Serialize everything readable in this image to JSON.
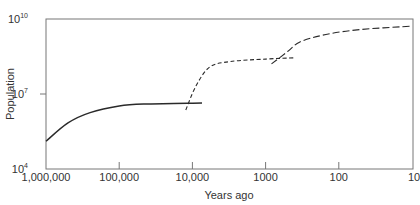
{
  "chart_data": {
    "type": "line",
    "title": "",
    "xlabel": "Years ago",
    "ylabel": "Population",
    "x_scale": "log-reversed",
    "y_scale": "log",
    "xlim": [
      1000000,
      10
    ],
    "ylim": [
      10000,
      10000000000
    ],
    "grid": false,
    "legend": "none",
    "x_ticks": [
      {
        "value": 1000000,
        "label": "1,000,000"
      },
      {
        "value": 100000,
        "label": "100,000"
      },
      {
        "value": 10000,
        "label": "10,000"
      },
      {
        "value": 1000,
        "label": "1000"
      },
      {
        "value": 100,
        "label": "100"
      },
      {
        "value": 10,
        "label": "10"
      }
    ],
    "y_ticks": [
      {
        "value": 10000,
        "base": "10",
        "exp": "4"
      },
      {
        "value": 10000000,
        "base": "10",
        "exp": "7"
      },
      {
        "value": 10000000000,
        "base": "10",
        "exp": "10"
      }
    ],
    "series": [
      {
        "name": "Tool-making (Paleolithic) phase",
        "style": "solid",
        "points": [
          {
            "years_ago": 1000000,
            "population": 130000
          },
          {
            "years_ago": 500000,
            "population": 700000
          },
          {
            "years_ago": 250000,
            "population": 1800000
          },
          {
            "years_ago": 100000,
            "population": 3300000
          },
          {
            "years_ago": 40000,
            "population": 4000000
          },
          {
            "years_ago": 7400,
            "population": 4400000
          }
        ]
      },
      {
        "name": "Agricultural phase",
        "style": "dashed",
        "points": [
          {
            "years_ago": 12300,
            "population": 2300000
          },
          {
            "years_ago": 9000,
            "population": 20000000
          },
          {
            "years_ago": 5800,
            "population": 120000000
          },
          {
            "years_ago": 3000,
            "population": 200000000
          },
          {
            "years_ago": 1000,
            "population": 250000000
          },
          {
            "years_ago": 400,
            "population": 280000000
          }
        ]
      },
      {
        "name": "Industrial phase",
        "style": "dashed",
        "points": [
          {
            "years_ago": 830,
            "population": 160000000
          },
          {
            "years_ago": 500,
            "population": 500000000
          },
          {
            "years_ago": 340,
            "population": 1200000000
          },
          {
            "years_ago": 150,
            "population": 2400000000
          },
          {
            "years_ago": 50,
            "population": 3800000000
          },
          {
            "years_ago": 10,
            "population": 5200000000
          }
        ]
      }
    ]
  }
}
